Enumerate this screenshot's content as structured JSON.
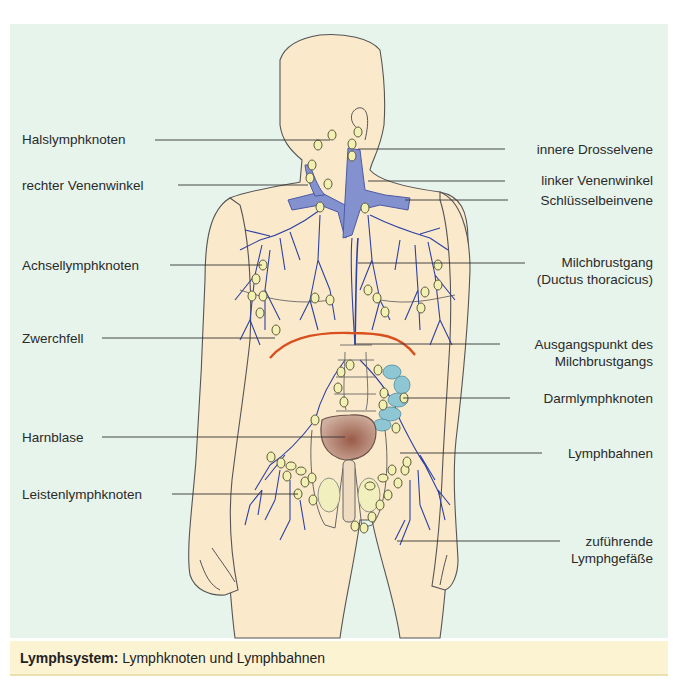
{
  "figure": {
    "title": "Lymphsystem",
    "colors": {
      "panel_background": "#e6f4ec",
      "skin": "#fbe9cc",
      "vein_fill": "#8391cf",
      "lymph_vessel": "#2e42a3",
      "lymph_node": "#f3f0b4",
      "diaphragm": "#d9501f",
      "bladder": "#a57a66",
      "intestine_nodes": "#8fc6d4",
      "caption_background": "#fbf3d2"
    }
  },
  "labels_left": [
    {
      "id": "halslymphknoten",
      "text": "Halslymphknoten"
    },
    {
      "id": "rechter-venenwinkel",
      "text": "rechter Venenwinkel"
    },
    {
      "id": "achsellymphknoten",
      "text": "Achsellymphknoten"
    },
    {
      "id": "zwerchfell",
      "text": "Zwerchfell"
    },
    {
      "id": "harnblase",
      "text": "Harnblase"
    },
    {
      "id": "leistenlymphknoten",
      "text": "Leistenlymphknoten"
    }
  ],
  "labels_right": [
    {
      "id": "innere-drosselvene",
      "lines": [
        "innere Drosselvene"
      ]
    },
    {
      "id": "linker-venenwinkel",
      "lines": [
        "linker Venenwinkel"
      ]
    },
    {
      "id": "schluesselbeinvene",
      "lines": [
        "Schlüsselbeinvene"
      ]
    },
    {
      "id": "milchbrustgang",
      "lines": [
        "Milchbrustgang",
        "(Ductus thoracicus)"
      ]
    },
    {
      "id": "ausgangspunkt",
      "lines": [
        "Ausgangspunkt des",
        "Milchbrustgangs"
      ]
    },
    {
      "id": "darmlymphknoten",
      "lines": [
        "Darmlymphknoten"
      ]
    },
    {
      "id": "lymphbahnen",
      "lines": [
        "Lymphbahnen"
      ]
    },
    {
      "id": "zufuehrende-lymphgefaesse",
      "lines": [
        "zuführende",
        "Lymphgefäße"
      ]
    }
  ],
  "caption": {
    "bold": "Lymphsystem:",
    "text": " Lymphknoten und Lymphbahnen"
  }
}
